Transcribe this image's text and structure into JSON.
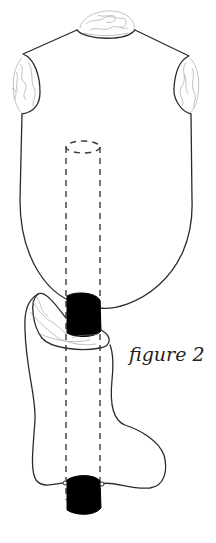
{
  "figure": {
    "caption": "figure 2",
    "parts": [
      {
        "name": "body-tube",
        "description": "upper body / torso piece with rounded bottom"
      },
      {
        "name": "neck-opening",
        "pattern": "topographic contour"
      },
      {
        "name": "left-armhole",
        "pattern": "topographic contour"
      },
      {
        "name": "right-armhole",
        "pattern": "topographic contour"
      },
      {
        "name": "sock-foot",
        "description": "lower foot/boot shape"
      },
      {
        "name": "sock-cuff-opening",
        "pattern": "topographic contour"
      },
      {
        "name": "dashed-cylinder",
        "style": "dashed"
      },
      {
        "name": "join-block-upper",
        "fill": "#000000"
      },
      {
        "name": "join-block-lower",
        "fill": "#000000"
      }
    ],
    "colors": {
      "line": "#2b2b2b",
      "fill": "#000000",
      "texture": "#9a9a9a",
      "background": "#ffffff"
    }
  }
}
